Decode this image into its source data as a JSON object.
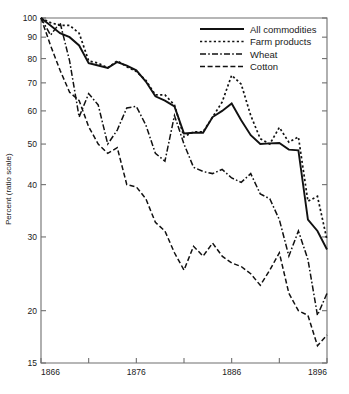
{
  "chart_data": {
    "type": "line",
    "title": "",
    "xlabel": "",
    "ylabel": "Percent (ratio scale)",
    "yscale": "log",
    "ylim": [
      15,
      100
    ],
    "xlim": [
      1866,
      1896
    ],
    "grid": false,
    "legend_position": "top-right",
    "y_ticks": [
      15,
      20,
      30,
      40,
      50,
      60,
      70,
      80,
      90,
      100
    ],
    "y_tick_labels": [
      "15",
      "20",
      "30",
      "40",
      "50",
      "60",
      "70",
      "80",
      "90",
      "100"
    ],
    "x_ticks": [
      1866,
      1871,
      1876,
      1881,
      1886,
      1891,
      1896
    ],
    "x_tick_labels": [
      "1866",
      "",
      "1876",
      "",
      "1886",
      "",
      "1896"
    ],
    "x": [
      1866,
      1867,
      1868,
      1869,
      1870,
      1871,
      1872,
      1873,
      1874,
      1875,
      1876,
      1877,
      1878,
      1879,
      1880,
      1881,
      1882,
      1883,
      1884,
      1885,
      1886,
      1887,
      1888,
      1889,
      1890,
      1891,
      1892,
      1893,
      1894,
      1895,
      1896
    ],
    "series": [
      {
        "name": "All commodities",
        "style": "solid",
        "values": [
          100,
          96,
          92,
          90,
          86,
          78,
          77,
          76,
          78.5,
          77,
          75,
          70.5,
          65,
          63.5,
          61.5,
          53,
          53.2,
          53.2,
          58,
          60,
          62.5,
          57,
          52.5,
          50,
          50.2,
          50.3,
          48.5,
          48.3,
          33,
          31,
          28
        ]
      },
      {
        "name": "Farm products",
        "style": "dotted",
        "values": [
          100,
          97.5,
          96,
          96,
          92,
          79,
          78,
          76,
          79,
          76.5,
          74.5,
          71,
          65.5,
          65.5,
          62,
          52,
          53.5,
          53.5,
          58,
          63,
          73,
          69.5,
          58.5,
          51.5,
          50,
          54.8,
          50.5,
          52,
          36.5,
          37.5,
          29.5
        ]
      },
      {
        "name": "Wheat",
        "style": "dashdot",
        "values": [
          100,
          91,
          97.5,
          79,
          58,
          66,
          62,
          50,
          54,
          61,
          61.5,
          55.5,
          47.5,
          45.5,
          58.5,
          50,
          44,
          43,
          42.5,
          43.5,
          41.5,
          40.5,
          42.5,
          38,
          37,
          33,
          27,
          31,
          26.5,
          19.5,
          22
        ]
      },
      {
        "name": "Cotton",
        "style": "dashed",
        "values": [
          100,
          86,
          75,
          66.5,
          63.5,
          55,
          50,
          47.5,
          49,
          40,
          39.5,
          37,
          32.5,
          31,
          27.5,
          25,
          28.5,
          27,
          29,
          27,
          26,
          25.5,
          24.5,
          23,
          25,
          27.5,
          22,
          20,
          19.5,
          16.5,
          17.5
        ]
      }
    ]
  },
  "legend": {
    "items": [
      {
        "label": "All commodities",
        "style": "solid"
      },
      {
        "label": "Farm products",
        "style": "dotted"
      },
      {
        "label": "Wheat",
        "style": "dashdot"
      },
      {
        "label": "Cotton",
        "style": "dashed"
      }
    ]
  },
  "axis": {
    "y_title": "Percent (ratio scale)"
  }
}
